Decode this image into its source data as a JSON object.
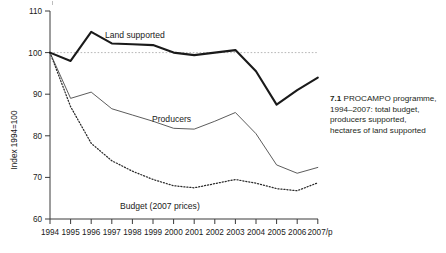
{
  "caption": {
    "number": "7.1",
    "text": "PROCAMPO programme, 1994–2007: total budget, producers supported, hectares of land supported"
  },
  "chart_data": {
    "type": "line",
    "title": "",
    "xlabel": "",
    "ylabel": "Index 1994=100",
    "ylim": [
      60,
      110
    ],
    "yticks": [
      60,
      70,
      80,
      90,
      100,
      110
    ],
    "ytick_labels": [
      "60",
      "70",
      "80",
      "90",
      "100",
      "110"
    ],
    "grid": "dotted reference line at y=100",
    "legend": "inline series labels",
    "categories": [
      "1994",
      "1995",
      "1996",
      "1997",
      "1998",
      "1999",
      "2000",
      "2001",
      "2002",
      "2003",
      "2004",
      "2005",
      "2006",
      "2007/p"
    ],
    "x": [
      "1994",
      "1995",
      "1996",
      "1997",
      "1998",
      "1999",
      "2000",
      "2001",
      "2002",
      "2003",
      "2004",
      "2005",
      "2006",
      "2007/p"
    ],
    "series": [
      {
        "name": "Land supported",
        "label": "Land supported",
        "style": "solid-bold",
        "values": [
          100,
          98,
          105,
          102.2,
          102,
          101.8,
          100,
          99.4,
          100,
          100.6,
          95.5,
          87.5,
          91,
          94
        ]
      },
      {
        "name": "Producers",
        "label": "Producers",
        "style": "solid-thin",
        "values": [
          100,
          89,
          90.5,
          86.5,
          85,
          83.5,
          81.8,
          81.6,
          83.5,
          85.6,
          80.5,
          73,
          71,
          72.4
        ]
      },
      {
        "name": "Budget (2007 prices)",
        "label": "Budget (2007 prices)",
        "style": "dotted",
        "values": [
          100,
          87,
          78.2,
          74,
          71.5,
          69.5,
          68,
          67.5,
          68.5,
          69.5,
          68.6,
          67.3,
          66.8,
          68.7
        ]
      }
    ]
  }
}
